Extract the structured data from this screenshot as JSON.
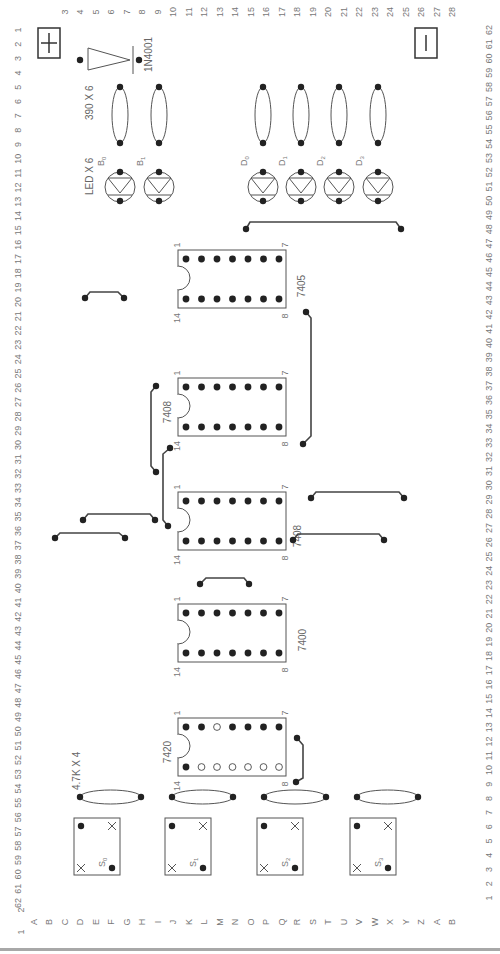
{
  "colors": {
    "ink": "#333333",
    "outline": "#555555",
    "label": "#777777",
    "pin_fill": "#222222",
    "rule": "#a8a8a8"
  },
  "axes": {
    "left_numbers": [
      "1",
      "2",
      "3",
      "4",
      "5",
      "6",
      "7",
      "8",
      "9",
      "10",
      "11",
      "12",
      "13",
      "14",
      "15",
      "16",
      "17",
      "18",
      "19",
      "20",
      "21",
      "22",
      "23",
      "24",
      "25",
      "26",
      "27",
      "28",
      "29",
      "30",
      "31",
      "32",
      "33",
      "34",
      "35",
      "36",
      "37",
      "38",
      "39",
      "40",
      "41",
      "42",
      "43",
      "44",
      "45",
      "46",
      "47",
      "48",
      "49",
      "50",
      "51",
      "52",
      "53",
      "54",
      "55",
      "56",
      "57",
      "58",
      "59",
      "60",
      "61",
      "62"
    ],
    "right_numbers": [
      "62",
      "61",
      "60",
      "59",
      "58",
      "57",
      "56",
      "55",
      "54",
      "53",
      "52",
      "51",
      "50",
      "49",
      "48",
      "47",
      "46",
      "45",
      "44",
      "43",
      "42",
      "41",
      "40",
      "39",
      "38",
      "37",
      "36",
      "35",
      "34",
      "33",
      "32",
      "31",
      "30",
      "29",
      "28",
      "27",
      "26",
      "25",
      "24",
      "23",
      "22",
      "21",
      "20",
      "19",
      "18",
      "17",
      "16",
      "15",
      "14",
      "13",
      "12",
      "11",
      "10",
      "9",
      "8",
      "7",
      "6",
      "5",
      "4",
      "3",
      "2",
      "1"
    ],
    "bottom_letters": [
      "A",
      "B",
      "C",
      "D",
      "E",
      "F",
      "G",
      "H",
      "I",
      "J",
      "K",
      "L",
      "M",
      "N",
      "O",
      "P",
      "Q",
      "R",
      "S",
      "T",
      "U",
      "V",
      "W",
      "X",
      "Y",
      "Z",
      "A",
      "B"
    ],
    "top_numbers": [
      "1",
      "2",
      "3",
      "4",
      "5",
      "6",
      "7",
      "8",
      "9",
      "10",
      "11",
      "12",
      "13",
      "14",
      "15",
      "16",
      "17",
      "18",
      "19",
      "20",
      "21",
      "22",
      "23",
      "24",
      "25",
      "26",
      "27",
      "28"
    ]
  },
  "power": {
    "positive_symbol": "+",
    "negative_symbol": "−"
  },
  "diode": {
    "label": "1N4001"
  },
  "resistors_top": {
    "label": "390 X 6"
  },
  "resistors_bottom": {
    "label": "4.7K X 4"
  },
  "leds": {
    "group_label": "LED X 6",
    "items": [
      {
        "name": "B",
        "sub": "0"
      },
      {
        "name": "B",
        "sub": "1"
      },
      {
        "name": "D",
        "sub": "0"
      },
      {
        "name": "D",
        "sub": "1"
      },
      {
        "name": "D",
        "sub": "2"
      },
      {
        "name": "D",
        "sub": "3"
      }
    ]
  },
  "switches": [
    {
      "name": "S",
      "sub": "0"
    },
    {
      "name": "S",
      "sub": "1"
    },
    {
      "name": "S",
      "sub": "2"
    },
    {
      "name": "S",
      "sub": "3"
    }
  ],
  "ics": [
    {
      "part": "7405",
      "pin1": "1",
      "pin7": "7",
      "pin8": "8",
      "pin14": "14"
    },
    {
      "part": "7408",
      "pin1": "1",
      "pin7": "7",
      "pin8": "8",
      "pin14": "14"
    },
    {
      "part": "7408",
      "pin1": "1",
      "pin7": "7",
      "pin8": "8",
      "pin14": "14"
    },
    {
      "part": "7400",
      "pin1": "1",
      "pin7": "7",
      "pin8": "8",
      "pin14": "14"
    },
    {
      "part": "7420",
      "pin1": "1",
      "pin7": "7",
      "pin8": "8",
      "pin14": "14"
    }
  ]
}
